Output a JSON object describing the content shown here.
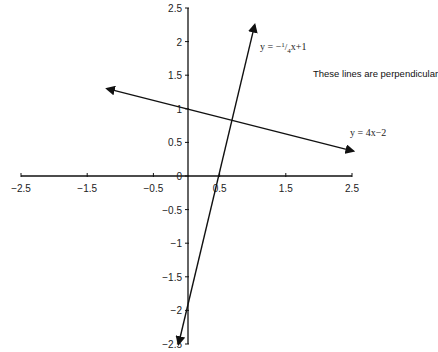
{
  "chart_data": {
    "type": "line",
    "title": "",
    "xlabel": "",
    "ylabel": "",
    "xlim": [
      -2.5,
      2.5
    ],
    "ylim": [
      -2.5,
      2.5
    ],
    "grid": false,
    "x_ticks": [
      "-2.5",
      "-1.5",
      "-0.5",
      "0.5",
      "1.5",
      "2.5"
    ],
    "y_ticks": [
      "2.5",
      "2",
      "1.5",
      "1",
      "0.5",
      "0",
      "-0.5",
      "-1",
      "-1.5",
      "-2",
      "-2.5"
    ],
    "origin_label": "0",
    "series": [
      {
        "name": "y = 4x - 2",
        "equation": "y = 4x - 2",
        "slope": 4,
        "intercept": -2,
        "x": [
          -0.12,
          1.03
        ],
        "y": [
          -2.5,
          2.25
        ],
        "arrows": "both"
      },
      {
        "name": "y = -1/4x + 1",
        "equation": "y = -1/4x + 1",
        "slope": -0.25,
        "intercept": 1,
        "x": [
          -1.2,
          2.52
        ],
        "y": [
          1.3,
          0.37
        ],
        "arrows": "both"
      }
    ],
    "annotations": [
      {
        "text": "y = −1⁄4x+1",
        "near": "steep line top",
        "x": 1.1,
        "y": 2.05
      },
      {
        "text": "These lines are perpendicular",
        "x": 1.6,
        "y": 1.4
      },
      {
        "text": "y = 4x−2",
        "near": "shallow line right end",
        "x": 2.05,
        "y": 0.6
      }
    ]
  },
  "labels": {
    "eq1": "y = −",
    "eq1_frac_num": "1",
    "eq1_frac_den": "4",
    "eq1_tail": "x+1",
    "note": "These lines are perpendicular",
    "eq2": "y = 4x−2"
  }
}
